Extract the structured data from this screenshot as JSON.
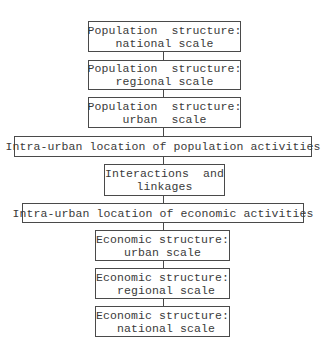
{
  "flowchart": {
    "boxes": [
      {
        "line1": "Population  structure:",
        "line2": "national scale"
      },
      {
        "line1": "Population  structure:",
        "line2": "regional scale"
      },
      {
        "line1": "Population  structure:",
        "line2": "urban  scale"
      },
      {
        "line1": "Intra-urban location of population activities"
      },
      {
        "line1": "Interactions  and",
        "line2": "linkages"
      },
      {
        "line1": "Intra-urban location of economic activities"
      },
      {
        "line1": "Economic structure:",
        "line2": "urban scale"
      },
      {
        "line1": "Economic structure:",
        "line2": " regional scale"
      },
      {
        "line1": "Economic structure:",
        "line2": " national scale"
      }
    ]
  }
}
